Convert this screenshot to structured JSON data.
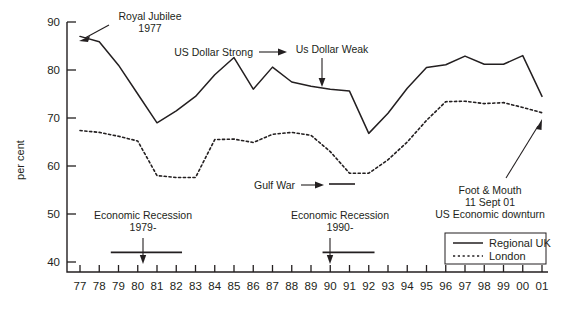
{
  "chart_data": {
    "type": "line",
    "title": "",
    "xlabel": "",
    "ylabel": "per cent",
    "xlim": [
      1977,
      2001
    ],
    "ylim": [
      40,
      90
    ],
    "grid": false,
    "legend_position": "bottom-right",
    "x": [
      1977,
      1978,
      1979,
      1980,
      1981,
      1982,
      1983,
      1984,
      1985,
      1986,
      1987,
      1988,
      1989,
      1990,
      1991,
      1992,
      1993,
      1994,
      1995,
      1996,
      1997,
      1998,
      1999,
      2000,
      2001
    ],
    "categories": [
      "77",
      "78",
      "79",
      "80",
      "81",
      "82",
      "83",
      "84",
      "85",
      "86",
      "87",
      "88",
      "89",
      "90",
      "91",
      "92",
      "93",
      "94",
      "95",
      "96",
      "97",
      "98",
      "99",
      "00",
      "01"
    ],
    "yticks": [
      40,
      50,
      60,
      70,
      80,
      90
    ],
    "series": [
      {
        "name": "Regional UK",
        "style": "solid",
        "values": [
          87.0,
          85.9,
          81.0,
          75.0,
          69.0,
          71.5,
          74.5,
          79.0,
          82.6,
          76.0,
          80.6,
          77.5,
          76.6,
          76.0,
          75.6,
          66.8,
          71.0,
          76.2,
          80.5,
          81.1,
          82.9,
          81.2,
          81.2,
          83.0,
          74.5
        ]
      },
      {
        "name": "London",
        "style": "dotted",
        "values": [
          67.4,
          67.0,
          66.2,
          65.2,
          58.0,
          57.6,
          57.6,
          65.5,
          65.6,
          64.9,
          66.6,
          67.0,
          66.4,
          63.0,
          58.5,
          58.5,
          61.3,
          65.0,
          69.5,
          73.4,
          73.5,
          73.0,
          73.2,
          72.2,
          71.1
        ]
      }
    ],
    "annotations": [
      {
        "id": "royal-jubilee",
        "lines": [
          "Royal Jubilee",
          "1977"
        ],
        "target_x": 1977,
        "target_y": 87.0
      },
      {
        "id": "us-dollar-strong",
        "lines": [
          "US Dollar Strong"
        ],
        "target_x": 1985,
        "target_y": 82.6
      },
      {
        "id": "us-dollar-weak",
        "lines": [
          "Us Dollar Weak"
        ],
        "target_x": 1991,
        "target_y": 75.6
      },
      {
        "id": "gulf-war",
        "lines": [
          "Gulf War"
        ],
        "target_x": 1991,
        "target_y": 58.5
      },
      {
        "id": "foot-mouth",
        "lines": [
          "Foot & Mouth",
          "11 Sept 01",
          "US Economic downturn"
        ],
        "target_x": 2001,
        "target_y": 71.1
      },
      {
        "id": "economic-recession-1979",
        "lines": [
          "Economic Recession",
          "1979-"
        ],
        "span_start": 1978.6,
        "span_end": 1982.3,
        "span_y": 42.0
      },
      {
        "id": "economic-recession-1990",
        "lines": [
          "Economic Recession",
          "1990-"
        ],
        "span_start": 1989.6,
        "span_end": 1992.3,
        "span_y": 42.0
      }
    ]
  },
  "axis": {
    "ylabel": "per cent",
    "ytick_labels": [
      "90",
      "80",
      "70",
      "60",
      "50",
      "40"
    ],
    "xtick_labels": [
      "77",
      "78",
      "79",
      "80",
      "81",
      "82",
      "83",
      "84",
      "85",
      "86",
      "87",
      "88",
      "89",
      "90",
      "91",
      "92",
      "93",
      "94",
      "95",
      "96",
      "97",
      "98",
      "99",
      "00",
      "01"
    ]
  },
  "annotations": {
    "royal_jubilee_line1": "Royal Jubilee",
    "royal_jubilee_line2": "1977",
    "us_dollar_strong": "US Dollar Strong",
    "us_dollar_weak": "Us Dollar Weak",
    "gulf_war": "Gulf War",
    "foot_mouth_line1": "Foot & Mouth",
    "foot_mouth_line2": "11 Sept 01",
    "foot_mouth_line3": "US Economic downturn",
    "recession_1979_line1": "Economic Recession",
    "recession_1979_line2": "1979-",
    "recession_1990_line1": "Economic Recession",
    "recession_1990_line2": "1990-"
  },
  "legend": {
    "items": [
      {
        "label": "Regional UK",
        "style": "solid"
      },
      {
        "label": "London",
        "style": "dotted"
      }
    ]
  },
  "colors": {
    "ink": "#231f20",
    "background": "#ffffff"
  }
}
